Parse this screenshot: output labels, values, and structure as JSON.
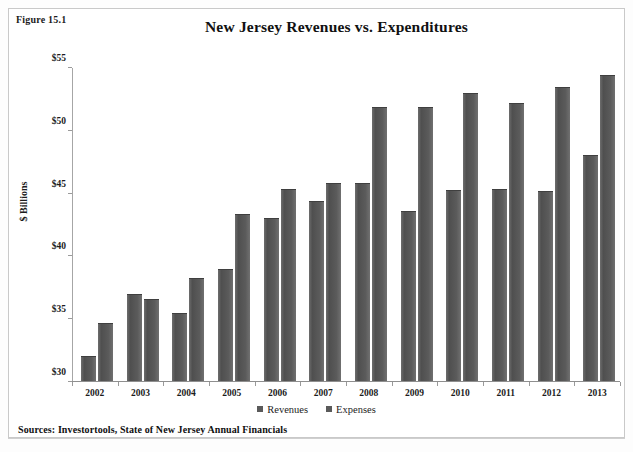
{
  "figure": {
    "label": "Figure 15.1",
    "title": "New Jersey Revenues vs. Expenditures",
    "source": "Sources: Investortools, State of New Jersey Annual Financials"
  },
  "legend": {
    "items": [
      {
        "label": "Revenues",
        "color": "#5a5a5a"
      },
      {
        "label": "Expenses",
        "color": "#5a5a5a"
      }
    ]
  },
  "axes": {
    "y_title": "$ Billions",
    "y_ticks": [
      "$30",
      "$35",
      "$40",
      "$45",
      "$50",
      "$55"
    ],
    "x_ticks": [
      "2002",
      "2003",
      "2004",
      "2005",
      "2006",
      "2007",
      "2008",
      "2009",
      "2010",
      "2011",
      "2012",
      "2013"
    ]
  },
  "chart_data": {
    "type": "bar",
    "title": "New Jersey Revenues vs. Expenditures",
    "xlabel": "",
    "ylabel": "$ Billions",
    "ylim": [
      30,
      55
    ],
    "ytick_step": 5,
    "grid": false,
    "legend_position": "bottom",
    "categories": [
      "2002",
      "2003",
      "2004",
      "2005",
      "2006",
      "2007",
      "2008",
      "2009",
      "2010",
      "2011",
      "2012",
      "2013"
    ],
    "series": [
      {
        "name": "Revenues",
        "color": "#5a5a5a",
        "values": [
          32.0,
          36.9,
          35.4,
          38.9,
          43.0,
          44.3,
          45.8,
          43.5,
          45.2,
          45.3,
          45.1,
          48.0
        ]
      },
      {
        "name": "Expenses",
        "color": "#5a5a5a",
        "values": [
          34.6,
          36.5,
          38.2,
          43.3,
          45.3,
          45.8,
          51.8,
          51.8,
          52.9,
          52.1,
          53.4,
          54.4
        ]
      }
    ],
    "annotations": [
      "Figure 15.1",
      "Sources: Investortools, State of New Jersey Annual Financials"
    ]
  }
}
